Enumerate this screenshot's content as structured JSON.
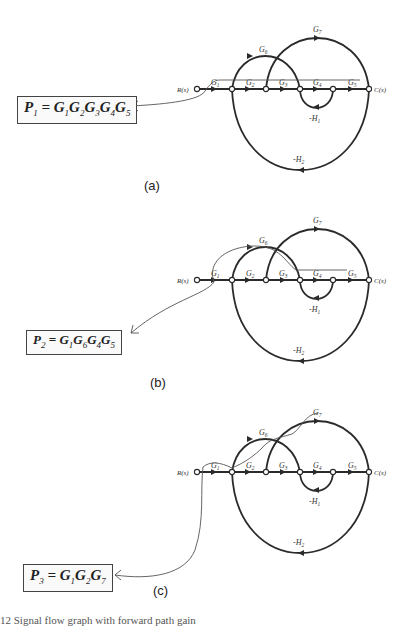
{
  "figure": {
    "panels": [
      {
        "id": "a",
        "label": "(a)",
        "path_name": "P",
        "path_index": "1",
        "gains": [
          [
            "G",
            "1"
          ],
          [
            "G",
            "2"
          ],
          [
            "G",
            "3"
          ],
          [
            "G",
            "4"
          ],
          [
            "G",
            "5"
          ]
        ],
        "equation_text": "P1 = G1G2G3G4G5",
        "highlighted_path": "R-G1-G2-G3-G4-G5-C"
      },
      {
        "id": "b",
        "label": "(b)",
        "path_name": "P",
        "path_index": "2",
        "gains": [
          [
            "G",
            "1"
          ],
          [
            "G",
            "6"
          ],
          [
            "G",
            "4"
          ],
          [
            "G",
            "5"
          ]
        ],
        "equation_text": "P2 = G1G6G4G5",
        "highlighted_path": "R-G1-G6-G4-G5-C"
      },
      {
        "id": "c",
        "label": "(c)",
        "path_name": "P",
        "path_index": "3",
        "gains": [
          [
            "G",
            "1"
          ],
          [
            "G",
            "2"
          ],
          [
            "G",
            "7"
          ]
        ],
        "equation_text": "P3 = G1G2G7",
        "highlighted_path": "R-G1-G2-G7-C"
      }
    ],
    "graph": {
      "input_label": "R(s)",
      "output_label": "C(s)",
      "branch_labels": {
        "G1": [
          "G",
          "1"
        ],
        "G2": [
          "G",
          "2"
        ],
        "G3": [
          "G",
          "3"
        ],
        "G4": [
          "G",
          "4"
        ],
        "G5": [
          "G",
          "5"
        ],
        "G6": [
          "G",
          "6"
        ],
        "G7": [
          "G",
          "7"
        ],
        "H1": [
          "-H",
          "1"
        ],
        "H2": [
          "-H",
          "2"
        ]
      }
    },
    "caption": "12  Signal flow graph with forward path gain"
  }
}
